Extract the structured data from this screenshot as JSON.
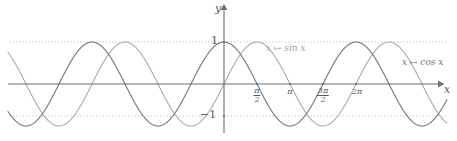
{
  "figure": {
    "title": "",
    "background_color": "#ffffff"
  },
  "axes": {
    "y_axis_label": "y",
    "x_axis_label": "x",
    "y_value_top_label": "1",
    "y_value_bottom_label": "−1",
    "axis_color": "#6b7076",
    "guide_color": "#a9aeb4"
  },
  "ticks": {
    "pi_over_2": {
      "numerator": "π",
      "denominator": "2"
    },
    "pi": "π",
    "three_pi_over_2": {
      "numerator": "3π",
      "denominator": "2"
    },
    "two_pi": "2π"
  },
  "legend": {
    "sine_label": "x ↦ sin x",
    "cosine_label": "x ↦ cos x",
    "sine_color": "#a6abb1",
    "cosine_color": "#70757b"
  },
  "chart_data": {
    "type": "line",
    "title": "",
    "xlabel": "x",
    "ylabel": "y",
    "xlim": [
      -4.86,
      3.28
    ],
    "ylim": [
      -1.22,
      1.22
    ],
    "grid": false,
    "gridlines_horizontal": [
      1,
      -1
    ],
    "legend_position": "inline-annotations",
    "xticks": [
      1.5708,
      3.14159,
      4.71239,
      6.28319
    ],
    "xticklabels": [
      "π/2",
      "π",
      "3π/2",
      "2π"
    ],
    "xtick_pixel_positions": [
      257,
      290,
      323,
      356
    ],
    "yticks": [
      1,
      -1
    ],
    "yticklabels": [
      "1",
      "−1"
    ],
    "x_units_per_pixel_period_px": 132,
    "amplitude_px": 42,
    "origin_px": {
      "x": 224,
      "y": 84
    },
    "series": [
      {
        "name": "x ↦ sin x",
        "function": "sin",
        "amplitude": 1,
        "phase": 0,
        "color": "#a6abb1",
        "x_start": -4.86,
        "x_end": 3.28
      },
      {
        "name": "x ↦ cos x",
        "function": "cos",
        "amplitude": 1,
        "phase": 1.5708,
        "color": "#70757b",
        "x_start": -4.86,
        "x_end": 3.28
      }
    ]
  }
}
